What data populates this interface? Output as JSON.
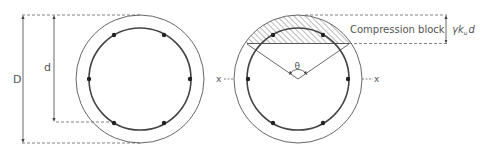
{
  "labels": {
    "outer_diameter": "D",
    "effective_depth": "d",
    "angle": "θ",
    "axis_left": "x",
    "axis_right": "x",
    "compression_block": "Compression block",
    "block_depth_gamma": "γk",
    "block_depth_sub": "u",
    "block_depth_d": "d"
  },
  "colors": {
    "line": "#444444",
    "dashed": "#666666",
    "bar": "#222222",
    "text": "#555555"
  }
}
